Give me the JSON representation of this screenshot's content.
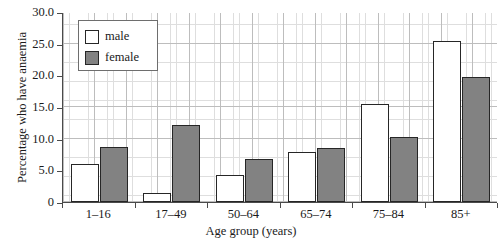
{
  "chart_data": {
    "type": "bar",
    "title": "",
    "categories": [
      "1–16",
      "17–49",
      "50–64",
      "65–74",
      "75–84",
      "85+"
    ],
    "series": [
      {
        "name": "male",
        "color": "#ffffff",
        "values": [
          6.0,
          1.5,
          4.3,
          7.9,
          15.4,
          25.5
        ]
      },
      {
        "name": "female",
        "color": "#828282",
        "values": [
          8.7,
          12.1,
          6.8,
          8.6,
          10.3,
          19.8
        ]
      }
    ],
    "xlabel": "Age group (years)",
    "ylabel": "Percentage who have anaemia",
    "ylim": [
      0,
      30
    ],
    "yticks": [
      "0",
      "5.0",
      "10.0",
      "15.0",
      "20.0",
      "25.0",
      "30.0"
    ],
    "ytick_values": [
      0,
      5,
      10,
      15,
      20,
      25,
      30
    ],
    "grid": "major and minor gridlines",
    "legend_position": "top-left inside plot area"
  },
  "legend": {
    "entries": [
      {
        "label": "male"
      },
      {
        "label": "female"
      }
    ]
  }
}
